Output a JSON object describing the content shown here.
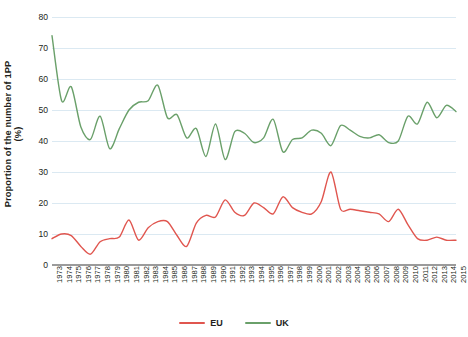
{
  "chart_data": {
    "type": "line",
    "title": "",
    "xlabel": "",
    "ylabel": "Proportion of the number of 1PP",
    "ylabel_units": "(%)",
    "ylim": [
      0,
      80
    ],
    "ytick_labels": [
      "0",
      "10",
      "20",
      "30",
      "40",
      "50",
      "60",
      "70",
      "80"
    ],
    "ytick_values": [
      0,
      10,
      20,
      30,
      40,
      50,
      60,
      70,
      80
    ],
    "grid": true,
    "legend_position": "bottom-center",
    "x": [
      "1973",
      "1974",
      "1975",
      "1976",
      "1977",
      "1978",
      "1979",
      "1980",
      "1981",
      "1982",
      "1983",
      "1984",
      "1985",
      "1986",
      "1987",
      "1988",
      "1989",
      "1990",
      "1991",
      "1992",
      "1993",
      "1994",
      "1995",
      "1996",
      "1997",
      "1998",
      "1999",
      "2000",
      "2001",
      "2002",
      "2003",
      "2004",
      "2005",
      "2006",
      "2007",
      "2008",
      "2009",
      "2010",
      "2011",
      "2012",
      "2013",
      "2014",
      "2015"
    ],
    "categories": [
      "1973",
      "1974",
      "1975",
      "1976",
      "1977",
      "1978",
      "1979",
      "1980",
      "1981",
      "1982",
      "1983",
      "1984",
      "1985",
      "1986",
      "1987",
      "1988",
      "1989",
      "1990",
      "1991",
      "1992",
      "1993",
      "1994",
      "1995",
      "1996",
      "1997",
      "1998",
      "1999",
      "2000",
      "2001",
      "2002",
      "2003",
      "2004",
      "2005",
      "2006",
      "2007",
      "2008",
      "2009",
      "2010",
      "2011",
      "2012",
      "2013",
      "2014",
      "2015"
    ],
    "series": [
      {
        "name": "EU",
        "color": "#e0564f",
        "values": [
          8.5,
          10.0,
          9.5,
          6.0,
          3.5,
          7.5,
          8.5,
          9.0,
          14.5,
          8.0,
          12.0,
          14.0,
          14.0,
          9.5,
          6.0,
          13.5,
          16.0,
          15.5,
          21.0,
          17.0,
          16.0,
          20.0,
          18.5,
          16.5,
          22.0,
          18.5,
          17.0,
          16.5,
          20.5,
          30.0,
          18.0,
          18.0,
          17.5,
          17.0,
          16.5,
          14.0,
          18.0,
          13.0,
          8.5,
          8.0,
          9.0,
          8.0,
          8.0
        ]
      },
      {
        "name": "UK",
        "color": "#6aa06a",
        "values": [
          74.0,
          53.0,
          57.5,
          44.5,
          40.5,
          48.0,
          37.5,
          44.0,
          50.0,
          52.5,
          53.0,
          58.0,
          47.5,
          48.5,
          41.0,
          44.0,
          35.0,
          45.5,
          34.0,
          43.0,
          42.5,
          39.5,
          41.0,
          47.0,
          36.5,
          40.5,
          41.0,
          43.5,
          42.5,
          38.5,
          45.0,
          43.5,
          41.5,
          41.0,
          42.0,
          39.5,
          40.0,
          48.0,
          45.5,
          52.5,
          47.5,
          51.5,
          49.5
        ]
      }
    ]
  },
  "legend": {
    "items": [
      {
        "label": "EU",
        "color": "#e0564f"
      },
      {
        "label": "UK",
        "color": "#6aa06a"
      }
    ]
  }
}
